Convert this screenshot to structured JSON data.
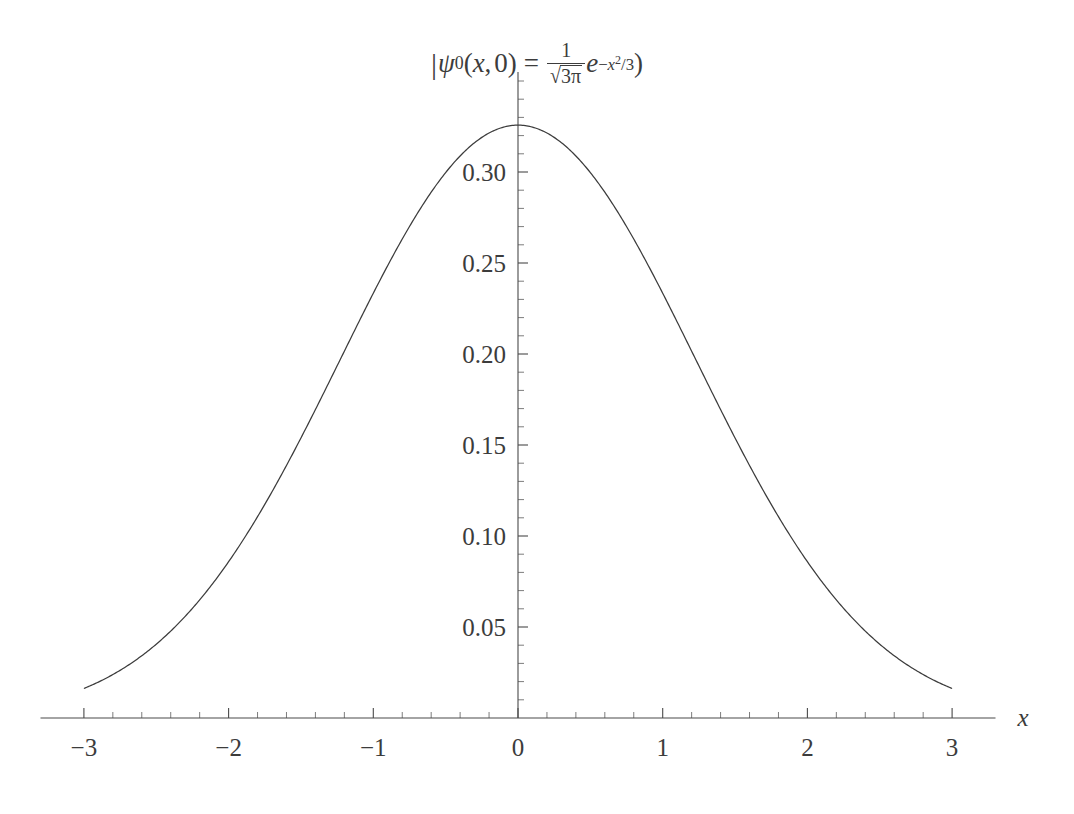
{
  "chart_data": {
    "type": "line",
    "title_parts": {
      "bar": "|",
      "psi": "ψ",
      "psi_sub": "0",
      "open_paren": "(",
      "var_x": "x",
      "comma": ",",
      "zero": "0",
      "close_paren": ")",
      "equals": "=",
      "frac_numerator": "1",
      "radical": "√",
      "frac_denominator_radicand": "3π",
      "exp_base": "e",
      "exp_minus": "−",
      "exp_x": "x",
      "exp_power": "2",
      "exp_div": "/3",
      "trailing_paren": ")"
    },
    "xlabel": "x",
    "ylabel": "",
    "xlim": [
      -3.3,
      3.3
    ],
    "ylim": [
      0,
      0.355
    ],
    "x_tick_labels": [
      "−3",
      "−2",
      "−1",
      "0",
      "1",
      "2",
      "3"
    ],
    "x_tick_values": [
      -3,
      -2,
      -1,
      0,
      1,
      2,
      3
    ],
    "x_minor_step": 0.2,
    "y_tick_labels": [
      "0.05",
      "0.10",
      "0.15",
      "0.20",
      "0.25",
      "0.30"
    ],
    "y_tick_values": [
      0.05,
      0.1,
      0.15,
      0.2,
      0.25,
      0.3
    ],
    "y_minor_step": 0.01,
    "grid": false,
    "legend": null,
    "function": "1/sqrt(3*pi)*exp(-x^2/3)",
    "amplitude": 0.325735,
    "peak": {
      "x": 0,
      "y": 0.3257
    },
    "x": [
      -3.0,
      -2.8,
      -2.6,
      -2.4,
      -2.2,
      -2.0,
      -1.8,
      -1.6,
      -1.4,
      -1.2,
      -1.0,
      -0.8,
      -0.6,
      -0.4,
      -0.2,
      0.0,
      0.2,
      0.4,
      0.6,
      0.8,
      1.0,
      1.2,
      1.4,
      1.6,
      1.8,
      2.0,
      2.2,
      2.4,
      2.6,
      2.8,
      3.0
    ],
    "y": [
      0.01456,
      0.02194,
      0.032,
      0.04506,
      0.06129,
      0.08051,
      0.10213,
      0.12518,
      0.14834,
      0.17005,
      0.18867,
      0.20268,
      0.21094,
      0.2129,
      0.20872,
      0.32574,
      0.20872,
      0.2129,
      0.21094,
      0.20268,
      0.18867,
      0.17005,
      0.14834,
      0.12518,
      0.10213,
      0.08051,
      0.06129,
      0.04506,
      0.032,
      0.02194,
      0.01456
    ],
    "curve_color": "#3c3c3c",
    "axis_color": "#4a4a4a",
    "background": "#ffffff"
  },
  "plot": {
    "axis_origin_label": "0"
  }
}
